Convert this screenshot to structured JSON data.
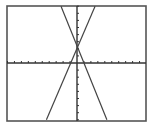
{
  "chart_data": {
    "type": "line",
    "title": "",
    "xlabel": "",
    "ylabel": "",
    "xlim": [
      -10,
      10
    ],
    "ylim": [
      -8,
      8
    ],
    "xscale_tick": 1,
    "yscale_tick": 1,
    "grid": false,
    "legend": "none",
    "series": [
      {
        "name": "line-1",
        "slope": -2.4,
        "intercept": 2.3,
        "x": [
          -2.3,
          4.3
        ],
        "y": [
          8,
          -8
        ]
      },
      {
        "name": "line-2",
        "slope": 2.3,
        "intercept": 2.3,
        "x": [
          -4.4,
          2.6
        ],
        "y": [
          -8,
          8
        ]
      }
    ],
    "intersection": {
      "x": 0,
      "y": 2.3
    }
  },
  "colors": {
    "background": "#ffffff",
    "frame": "#555555",
    "axes": "#333333",
    "lines": "#444444"
  },
  "layout": {
    "frame": {
      "left": 7,
      "top": 6,
      "right": 146,
      "bottom": 121
    },
    "origin": {
      "x": 77,
      "y": 63
    },
    "px_per_unit_x": 6.95,
    "px_per_unit_y": 7.1
  }
}
